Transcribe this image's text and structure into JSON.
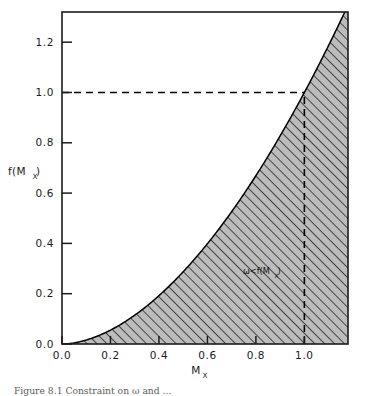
{
  "figure": {
    "caption": "Figure 8.1 Constraint on ω and ...",
    "annotation_text": "ω<f(M",
    "annotation_sub": "X",
    "annotation_close": ")"
  },
  "chart_data": {
    "type": "line",
    "title": "",
    "subtitle": "",
    "xlabel": "M",
    "xlabel_sub": "X",
    "ylabel": "f(M",
    "ylabel_sub": "X",
    "ylabel_close": ")",
    "xlim": [
      0.0,
      1.18
    ],
    "ylim": [
      0.0,
      1.32
    ],
    "xticks": [
      0.0,
      0.2,
      0.4,
      0.6,
      0.8,
      1.0
    ],
    "yticks": [
      0.0,
      0.2,
      0.4,
      0.6,
      0.8,
      1.0,
      1.2
    ],
    "xticklabels": [
      "0.0",
      "0.2",
      "0.4",
      "0.6",
      "0.8",
      "1.0"
    ],
    "yticklabels": [
      "0.0",
      "0.2",
      "0.4",
      "0.6",
      "0.8",
      "1.0",
      "1.2"
    ],
    "grid": false,
    "legend": null,
    "series": [
      {
        "name": "f(M_X)",
        "exponent": 1.8,
        "x": [
          0.0,
          0.05,
          0.1,
          0.15,
          0.2,
          0.25,
          0.3,
          0.35,
          0.4,
          0.45,
          0.5,
          0.55,
          0.6,
          0.65,
          0.7,
          0.75,
          0.8,
          0.85,
          0.9,
          0.95,
          1.0,
          1.05,
          1.1,
          1.15,
          1.18
        ],
        "y": [
          0.0,
          0.0052,
          0.0182,
          0.0371,
          0.0631,
          0.0929,
          0.1292,
          0.1695,
          0.2144,
          0.2638,
          0.3176,
          0.3758,
          0.4382,
          0.505,
          0.5759,
          0.651,
          0.7303,
          0.8136,
          0.9011,
          0.9925,
          1.0881,
          1.1876,
          1.2911,
          1.3986,
          1.4648
        ]
      }
    ],
    "reference_lines": [
      {
        "name": "horizontal-dashed",
        "orientation": "horizontal",
        "value": 1.0,
        "from_x": 0.0,
        "to_x": 1.0,
        "style": "dashed"
      },
      {
        "name": "vertical-dashed",
        "orientation": "vertical",
        "value": 1.0,
        "from_y": 0.0,
        "to_y": 1.0,
        "style": "dashed"
      }
    ],
    "shaded_region": {
      "label": "ω<f(M_X)",
      "fill": "#b9b9b9",
      "hatch": "//",
      "description": "region under the curve"
    },
    "annotations": [
      {
        "text": "ω<f(M_X)",
        "x": 0.79,
        "y": 0.33
      }
    ],
    "colors": {
      "curve": "#000000",
      "axis": "#1b1b1b",
      "shade_fill": "#bcbcbc",
      "hatch_line": "#2b2b2b",
      "dashed": "#000000",
      "background": "#ffffff"
    }
  }
}
